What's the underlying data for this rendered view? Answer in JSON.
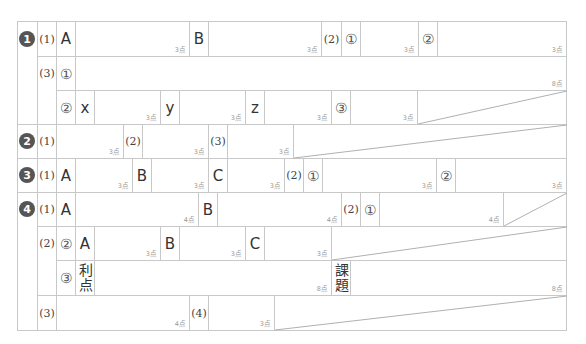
{
  "questions": [
    {
      "num": "1"
    },
    {
      "num": "2"
    },
    {
      "num": "3"
    },
    {
      "num": "4"
    }
  ],
  "labels": {
    "p1": "(1)",
    "p2": "(2)",
    "p3": "(3)",
    "p4": "(4)",
    "c1": "①",
    "c2": "②",
    "c3": "③",
    "A": "A",
    "B": "B",
    "C": "C",
    "x": "x",
    "y": "y",
    "z": "z",
    "riten": "利点",
    "kadai": "課題"
  },
  "points": {
    "p3": "3点",
    "p4": "4点",
    "p8": "8点"
  },
  "colors": {
    "border": "#c8c8c8",
    "badge": "#555555",
    "points_text": "#999999"
  }
}
